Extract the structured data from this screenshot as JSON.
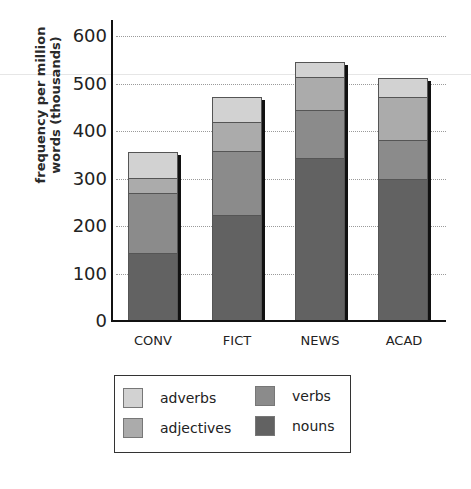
{
  "chart_data": {
    "type": "bar",
    "stacked": true,
    "title": "",
    "xlabel": "",
    "ylabel": "frequency per million words (thousands)",
    "ylabel_lines": [
      "frequency per million",
      "words (thousands)"
    ],
    "ylim": [
      0,
      600
    ],
    "yticks": [
      0,
      100,
      200,
      300,
      400,
      500,
      600
    ],
    "grid": "horizontal dotted",
    "legend_position": "below",
    "categories": [
      "CONV",
      "FICT",
      "NEWS",
      "ACAD"
    ],
    "series": [
      {
        "name": "nouns",
        "color": "#626262",
        "values": [
          143,
          223,
          343,
          299
        ]
      },
      {
        "name": "verbs",
        "color": "#8b8b8b",
        "values": [
          126,
          135,
          101,
          82
        ]
      },
      {
        "name": "adjectives",
        "color": "#ababab",
        "values": [
          32,
          61,
          70,
          91
        ]
      },
      {
        "name": "adverbs",
        "color": "#d2d2d2",
        "values": [
          55,
          52,
          31,
          40
        ]
      }
    ],
    "totals": [
      356,
      471,
      545,
      512
    ]
  },
  "legend": {
    "items": [
      {
        "label": "adverbs",
        "color": "#d2d2d2"
      },
      {
        "label": "adjectives",
        "color": "#ababab"
      },
      {
        "label": "verbs",
        "color": "#8b8b8b"
      },
      {
        "label": "nouns",
        "color": "#626262"
      }
    ]
  }
}
